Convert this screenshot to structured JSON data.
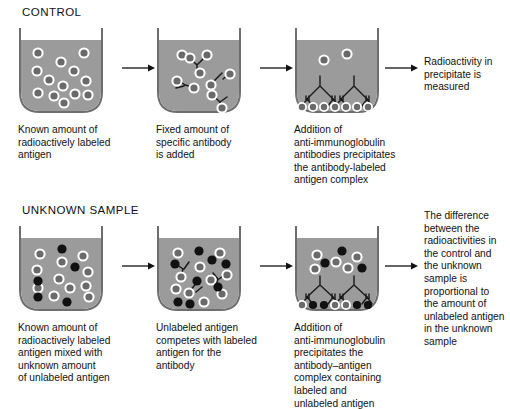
{
  "figure": {
    "type": "radioimmunoassay-diagram",
    "background": "#ffffff",
    "colors": {
      "beaker_fill": "#9b9b9b",
      "beaker_outline": "#6e6e6e",
      "labeled_antigen_fill": "#6a6a6a",
      "labeled_antigen_ring": "#ffffff",
      "unlabeled_antigen_fill": "#111111",
      "antibody_stroke": "#1a1a1a",
      "text": "#111111"
    }
  },
  "rows": [
    {
      "id": "control",
      "title": "CONTROL",
      "steps": [
        {
          "beaker_name": "beaker-control-1",
          "caption": "Known amount of\nradioactively labeled\nantigen"
        },
        {
          "beaker_name": "beaker-control-2",
          "caption": "Fixed amount of\nspecific antibody\nis added"
        },
        {
          "beaker_name": "beaker-control-3",
          "caption": "Addition of\nanti-immunoglobulin\nantibodies precipitates\nthe antibody-labeled\nantigen complex"
        }
      ],
      "result": "Radioactivity in\nprecipitate is\nmeasured"
    },
    {
      "id": "unknown-sample",
      "title": "UNKNOWN SAMPLE",
      "steps": [
        {
          "beaker_name": "beaker-unknown-1",
          "caption": "Known amount of\nradioactively labeled\nantigen mixed with\nunknown amount\nof unlabeled antigen"
        },
        {
          "beaker_name": "beaker-unknown-2",
          "caption": "Unlabeled antigen\ncompetes with labeled\nantigen for the\nantibody"
        },
        {
          "beaker_name": "beaker-unknown-3",
          "caption": "Addition of\nanti-immunoglobulin\nprecipitates the\nantibody–antigen\ncomplex containing\nlabeled and\nunlabeled antigen"
        }
      ],
      "result": "The difference\nbetween the\nradioactivities in\nthe control and\nthe unknown\nsample is\nproportional to\nthe amount of\nunlabeled antigen\nin the unknown\nsample"
    }
  ],
  "legend_semantics": {
    "labeled_antigen": "gray circle with white ring = radioactively labeled antigen",
    "unlabeled_antigen": "solid black circle = unlabeled antigen",
    "antibody": "Y-shaped specific antibody",
    "anti_immunoglobulin": "branched lattice of anti-immunoglobulin antibodies forming precipitate"
  }
}
